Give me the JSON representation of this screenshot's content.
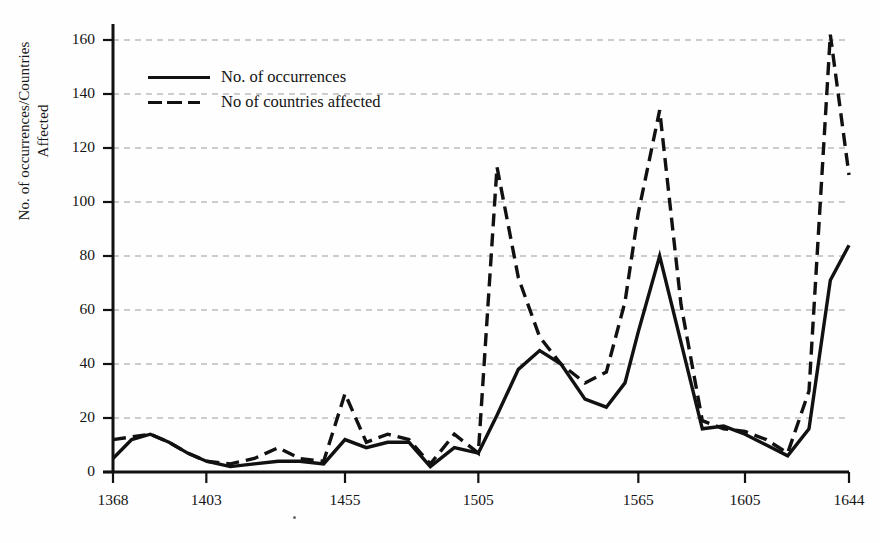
{
  "chart_data": {
    "type": "line",
    "title": "",
    "xlabel": "",
    "ylabel": "No. of occurrences/Countries Affected",
    "ylabel_line1": "No. of occurrences/Countries",
    "ylabel_line2": "Affected",
    "ylim": [
      0,
      170
    ],
    "ytick_values": [
      0,
      20,
      40,
      60,
      80,
      100,
      120,
      140,
      160
    ],
    "ytick_labels": [
      "0",
      "20",
      "40",
      "60",
      "80",
      "100",
      "120",
      "140",
      "160"
    ],
    "grid": true,
    "grid_style": "dashed-horizontal",
    "legend_position": "upper-left-inside",
    "xlim": [
      1368,
      1644
    ],
    "xtick_values": [
      1368,
      1403,
      1455,
      1505,
      1565,
      1605,
      1644
    ],
    "xtick_labels": [
      "1368",
      "1403",
      "1455",
      "1505",
      "1565",
      "1605",
      "1644"
    ],
    "x": [
      1368,
      1375,
      1382,
      1389,
      1396,
      1403,
      1412,
      1421,
      1430,
      1438,
      1447,
      1455,
      1463,
      1471,
      1479,
      1487,
      1496,
      1505,
      1512,
      1520,
      1528,
      1536,
      1545,
      1553,
      1560,
      1565,
      1573,
      1581,
      1589,
      1597,
      1605,
      1613,
      1621,
      1629,
      1637,
      1644
    ],
    "series": [
      {
        "name": "No. of occurrences",
        "style": "solid",
        "color": "#111111",
        "values": [
          5,
          12,
          14,
          11,
          7,
          4,
          2,
          3,
          4,
          4,
          3,
          12,
          9,
          11,
          11,
          2,
          9,
          7,
          21,
          38,
          45,
          40,
          27,
          24,
          33,
          52,
          80,
          48,
          16,
          17,
          14,
          10,
          6,
          16,
          71,
          84
        ]
      },
      {
        "name": "No of countries affected",
        "style": "dashed",
        "color": "#111111",
        "values": [
          12,
          13,
          14,
          11,
          7,
          4,
          3,
          5,
          9,
          5,
          4,
          29,
          11,
          14,
          12,
          3,
          14,
          7,
          113,
          72,
          50,
          40,
          33,
          37,
          63,
          96,
          134,
          62,
          19,
          16,
          15,
          12,
          7,
          30,
          162,
          110
        ]
      }
    ]
  }
}
